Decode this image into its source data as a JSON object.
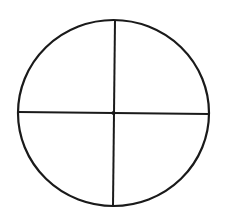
{
  "diagram": {
    "type": "circle-divided-into-quadrants",
    "background": "#ffffff",
    "stroke_color": "#1a1a1a",
    "circle": {
      "cx": 113.5,
      "cy": 113,
      "rx": 95.5,
      "ry": 93
    },
    "vertical_line": {
      "x1": 115,
      "y1": 20,
      "x2": 113,
      "y2": 206
    },
    "horizontal_line": {
      "x1": 18,
      "y1": 112,
      "x2": 209,
      "y2": 114
    },
    "center_point": {
      "cx": 113.5,
      "cy": 113,
      "r": 2
    },
    "quadrants": 4
  }
}
